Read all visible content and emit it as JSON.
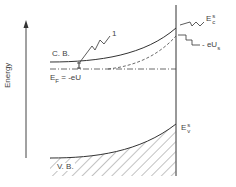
{
  "diagram": {
    "type": "band-bending energy diagram",
    "axis": {
      "label": "Energy"
    },
    "labels": {
      "conduction_band": "C. B.",
      "valence_band": "V. B.",
      "fermi_main": "E",
      "fermi_sub": "F",
      "fermi_eq": " = -eU",
      "marker_1": "1",
      "ec_main": "E",
      "ec_sup": "s",
      "ec_sub": "c",
      "ev_main": "E",
      "ev_sup": "s",
      "ev_sub": "v",
      "eus_main": "- eU",
      "eus_sub": "s"
    },
    "colors": {
      "line": "#333333",
      "hatch": "#555555",
      "background": "#ffffff"
    }
  }
}
